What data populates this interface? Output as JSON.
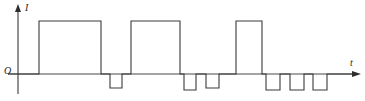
{
  "figure": {
    "title": "",
    "background_color": "#ffffff",
    "line_color": "#3a3a3a",
    "axis_color": "#4a4a4a",
    "stroke_width": 1
  },
  "axes": {
    "y_axis": {
      "label": "I",
      "label_name": "current",
      "origin_x": 18,
      "top_y": 5,
      "bottom_y": 94,
      "arrow": "up"
    },
    "x_axis": {
      "label": "t",
      "label_name": "time",
      "baseline_y": 74,
      "start_x": 8,
      "end_x": 360,
      "arrow": "right"
    },
    "origin_label": "O"
  },
  "chart_data": {
    "type": "line",
    "title": "",
    "xlabel": "t",
    "ylabel": "I",
    "grid": false,
    "legend": null,
    "baseline_value": 0,
    "pulses": [
      {
        "index": 1,
        "polarity": "positive",
        "x_start": 39,
        "x_end": 101,
        "level_y": 21,
        "height_px": 53,
        "width_px": 62
      },
      {
        "index": 2,
        "polarity": "negative",
        "x_start": 110,
        "x_end": 122,
        "level_y": 88,
        "height_px": 14,
        "width_px": 12
      },
      {
        "index": 3,
        "polarity": "positive",
        "x_start": 131,
        "x_end": 180,
        "level_y": 21,
        "height_px": 53,
        "width_px": 49
      },
      {
        "index": 4,
        "polarity": "negative",
        "x_start": 184,
        "x_end": 196,
        "level_y": 90,
        "height_px": 16,
        "width_px": 12
      },
      {
        "index": 5,
        "polarity": "negative",
        "x_start": 206,
        "x_end": 219,
        "level_y": 88,
        "height_px": 14,
        "width_px": 13
      },
      {
        "index": 6,
        "polarity": "positive",
        "x_start": 236,
        "x_end": 262,
        "level_y": 21,
        "height_px": 53,
        "width_px": 26
      },
      {
        "index": 7,
        "polarity": "negative",
        "x_start": 266,
        "x_end": 280,
        "level_y": 90,
        "height_px": 16,
        "width_px": 14
      },
      {
        "index": 8,
        "polarity": "negative",
        "x_start": 290,
        "x_end": 304,
        "level_y": 90,
        "height_px": 16,
        "width_px": 14
      },
      {
        "index": 9,
        "polarity": "negative",
        "x_start": 313,
        "x_end": 327,
        "level_y": 90,
        "height_px": 16,
        "width_px": 14
      }
    ],
    "waveform_path": "M 8 74 L 39 74 L 39 21 L 101 21 L 101 74 L 110 74 L 110 88 L 122 88 L 122 74 L 131 74 L 131 21 L 180 21 L 180 74 L 184 74 L 184 90 L 196 90 L 196 74 L 206 74 L 206 88 L 219 88 L 219 74 L 236 74 L 236 21 L 262 21 L 262 74 L 266 74 L 266 90 L 280 90 L 280 74 L 290 74 L 290 90 L 304 90 L 304 74 L 313 74 L 313 90 L 327 90 L 327 74 L 352 74"
  }
}
